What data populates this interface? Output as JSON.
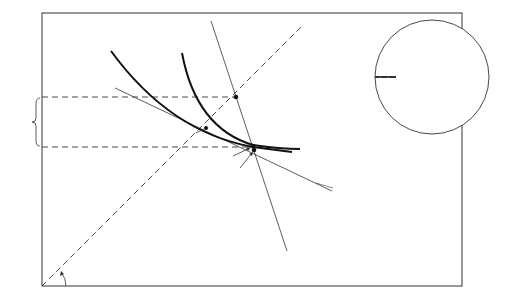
{
  "figure": {
    "corner_labels": {
      "top_right_line1": "Risk",
      "top_right_line2": "Neutral",
      "bottom_left_line1": "Risk",
      "bottom_left_line2": "Averse"
    },
    "angle_label": "45°",
    "bracket_label": "D",
    "curves": {
      "uh_main": "U",
      "uh_sub": "H",
      "ul_main": "U",
      "ul_sub": "L"
    },
    "points": {
      "h": "H",
      "l": "L",
      "ie": "IE",
      "inset_l": "L",
      "inset_ie": "IE"
    },
    "lines": {
      "high_premium": "High Premium",
      "low_premium": "Low Premium"
    },
    "colors": {
      "ink": "#1a1a1a",
      "background": "#ffffff"
    }
  }
}
